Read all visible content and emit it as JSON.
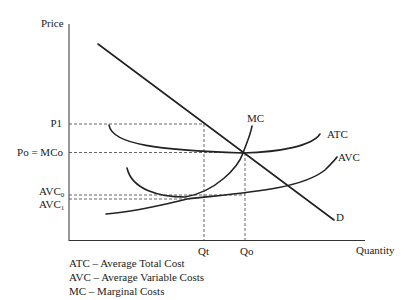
{
  "axes": {
    "y_label": "Price",
    "x_label": "Quantity"
  },
  "price_labels": {
    "p1": "P1",
    "po": "Po = MCo",
    "avc0_base": "AVC",
    "avc0_sub": "0",
    "avc1_base": "AVC",
    "avc1_sub": "1"
  },
  "quantity_labels": {
    "qt": "Qt",
    "qo": "Qo"
  },
  "curve_labels": {
    "mc": "MC",
    "atc": "ATC",
    "avc": "AVC",
    "d": "D"
  },
  "legend": [
    "ATC – Average Total Cost",
    "AVC – Average Variable Costs",
    "MC – Marginal Costs"
  ],
  "colors": {
    "line": "#222222",
    "dash": "#555555"
  }
}
